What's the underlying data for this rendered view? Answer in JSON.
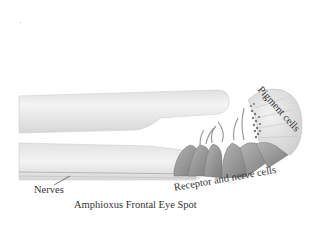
{
  "figure": {
    "title": "Amphioxus Frontal Eye Spot",
    "labels": {
      "pigment": "Pigment cells",
      "receptor": "Receptor and nerve cells",
      "nerves": "Nerves"
    },
    "colors": {
      "tube_light": "#f2f2f2",
      "tube_mid": "#d9d9d9",
      "tube_edge": "#c4c4c4",
      "receptor_dark": "#8a8a8a",
      "receptor_mid": "#a8a8a8",
      "pigment_cup": "#e6e6e6",
      "text": "#333333"
    }
  }
}
